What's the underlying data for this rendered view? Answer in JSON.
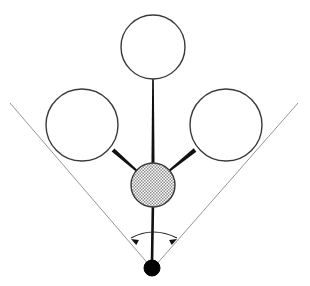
{
  "figure": {
    "canvas": {
      "width": 310,
      "height": 286,
      "background": "#ffffff"
    },
    "colors": {
      "outline": "#3a3a3a",
      "bond_dark": "#111111",
      "guide_line": "#8a8a8a",
      "hatch_dot": "#8e8e8e",
      "hatch_background": "#ffffff",
      "apex_fill": "#000000",
      "arc_stroke": "#222222"
    },
    "atoms": [
      {
        "name": "ligand-top",
        "shape": "open-circle",
        "cx": 153,
        "cy": 47,
        "r": 32,
        "stroke_width": 1.4,
        "fill": "none"
      },
      {
        "name": "ligand-left",
        "shape": "open-circle",
        "cx": 82,
        "cy": 125,
        "r": 36,
        "stroke_width": 1.4,
        "fill": "none"
      },
      {
        "name": "ligand-right",
        "shape": "open-circle",
        "cx": 226,
        "cy": 125,
        "r": 36,
        "stroke_width": 1.4,
        "fill": "none"
      },
      {
        "name": "central-atom",
        "shape": "hatched-circle",
        "cx": 153,
        "cy": 185,
        "r": 22,
        "stroke_width": 1.4,
        "fill": "hatch-pattern"
      },
      {
        "name": "apex-atom",
        "shape": "filled-circle",
        "cx": 152,
        "cy": 268,
        "r": 8,
        "stroke_width": 1,
        "fill": "#000000"
      }
    ],
    "bonds": [
      {
        "name": "bond-center-to-left",
        "x1": 113,
        "y1": 150,
        "x2": 137,
        "y2": 171,
        "width_start": 4.2,
        "width_end": 2.2,
        "style": "tapered-wedge"
      },
      {
        "name": "bond-center-to-right",
        "x1": 195,
        "y1": 150,
        "x2": 169,
        "y2": 171,
        "width_start": 4.2,
        "width_end": 2.2,
        "style": "tapered-wedge"
      },
      {
        "name": "bond-center-to-top",
        "x1": 153,
        "y1": 71,
        "x2": 153,
        "y2": 170,
        "width_start": 1.5,
        "width_end": 3.2,
        "style": "tapered-wedge"
      },
      {
        "name": "bond-center-to-apex",
        "x1": 153,
        "y1": 200,
        "x2": 152,
        "y2": 262,
        "width_start": 2.6,
        "width_end": 2.6,
        "style": "line"
      }
    ],
    "guide_lines": [
      {
        "name": "guide-line-left",
        "x1": 10,
        "y1": 103,
        "x2": 150,
        "y2": 266,
        "width": 0.9
      },
      {
        "name": "guide-line-right",
        "x1": 298,
        "y1": 103,
        "x2": 155,
        "y2": 266,
        "width": 0.9
      }
    ],
    "angle_indicator": {
      "name": "bond-angle-arc",
      "arc_path": "M 131 238 Q 153 226 177 238",
      "stroke_width": 1.2,
      "arrow_left": {
        "tip_x": 131,
        "tip_y": 239,
        "angle_deg": 208
      },
      "arrow_right": {
        "tip_x": 177,
        "tip_y": 239,
        "angle_deg": 332
      },
      "arrow_size": 8,
      "label": ""
    }
  }
}
